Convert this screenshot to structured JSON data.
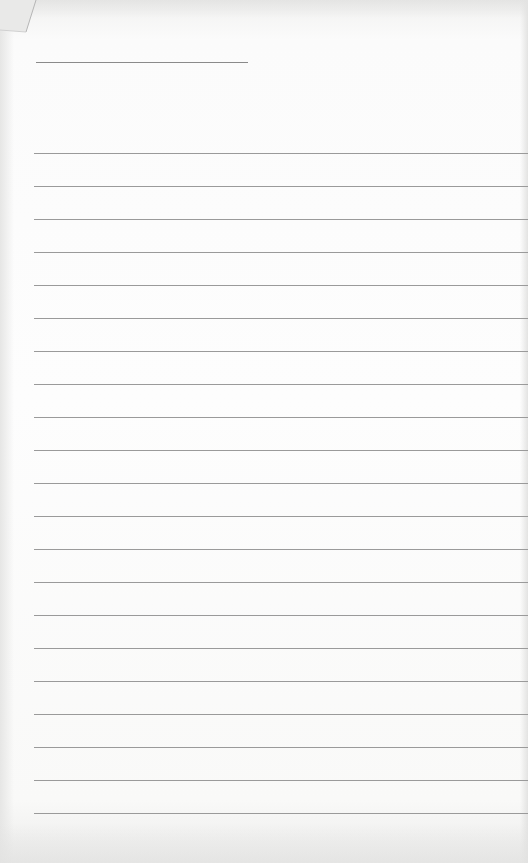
{
  "scene": {
    "description": "Sheet of blank lined paper",
    "paper_color": "#fbfbfb",
    "rule_color": "#9a9a9a"
  },
  "header_line": {
    "top": 62,
    "left": 36,
    "width": 212
  },
  "ruled_lines": {
    "count": 21,
    "first_top": 153,
    "spacing": 33
  }
}
